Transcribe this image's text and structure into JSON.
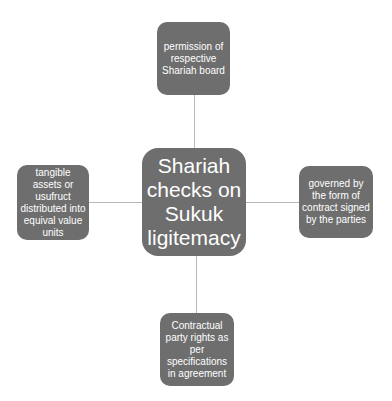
{
  "diagram": {
    "center": {
      "label": "Shariah checks on Sukuk ligitemacy"
    },
    "nodes": {
      "top": {
        "label": "permission of respective Shariah board"
      },
      "left": {
        "label": "tangible assets or usufruct distributed into equival value units"
      },
      "right": {
        "label": "governed by the form of contract signed by the parties"
      },
      "bottom": {
        "label": "Contractual party rights as per specifications in agreement"
      }
    },
    "colors": {
      "node_fill": "#6e6e6e",
      "node_text": "#ffffff",
      "connector": "#b8b8b8",
      "background": "#ffffff"
    }
  }
}
